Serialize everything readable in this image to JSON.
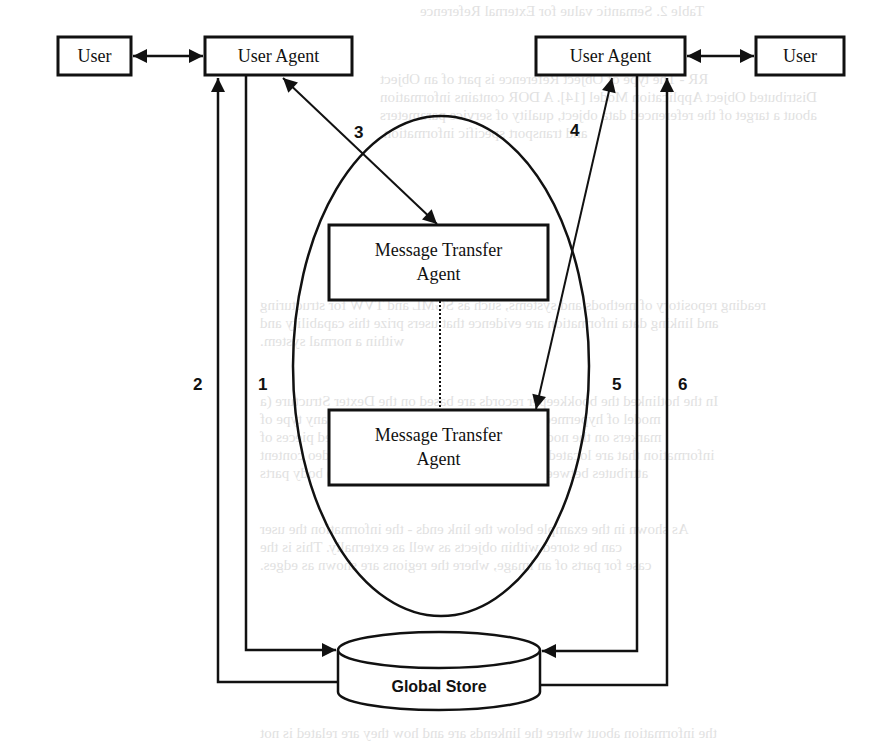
{
  "diagram": {
    "nodes": {
      "user_left": "User",
      "user_agent_left": "User Agent",
      "user_agent_right": "User Agent",
      "user_right": "User",
      "mta_top": [
        "Message Transfer",
        "Agent"
      ],
      "mta_bottom": [
        "Message Transfer",
        "Agent"
      ],
      "global_store": "Global Store"
    },
    "edge_labels": {
      "e1": "1",
      "e2": "2",
      "e3": "3",
      "e4": "4",
      "e5": "5",
      "e6": "6"
    },
    "colors": {
      "stroke": "#111111",
      "background": "#ffffff",
      "bleed_text": "#c9c9c9"
    }
  },
  "bleed_through_text": [
    "Table 2. Semantic value for External Reference",
    "RR - The type of Object Reference is part of an Object",
    "Distributed Object Application Model [14]. A DOR contains information",
    "about a target of the referenced data object, quality of service parameters",
    "and transport specific information.",
    "Structured Messages",
    "reading repository of methods and systems, such as SGML and TVW for structuring",
    "and linking data information are evidence that users prize this capability and",
    "within a normal system.",
    "In the hotlinked the bookkeeper records are based on the Dexter Structure (a",
    "model of hypermedia systems). It enables users to map any type of",
    "markers on the nodes, thus allowing links to cross related pieces of",
    "information that are located, e.g. to annotate text with an icon video content",
    "attributes between text and other (e.g. audio or video) body parts",
    "As shown in the example below the link ends - the information the user",
    "can be stored within objects as well as externally. This is the",
    "case for parts of an image, where the regions are shown as edges.",
    "the information about where the linkends are and how they are related is not"
  ]
}
